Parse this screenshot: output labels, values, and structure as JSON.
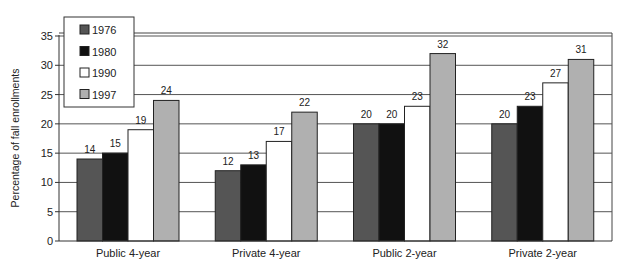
{
  "chart_data": {
    "type": "bar",
    "title": "",
    "xlabel": "",
    "ylabel": "Percentage of fall enrollments",
    "ylim": [
      0,
      35
    ],
    "yticks": [
      0,
      5,
      10,
      15,
      20,
      25,
      30,
      35
    ],
    "grid": true,
    "legend_position": "top-left",
    "categories": [
      "Public 4-year",
      "Private 4-year",
      "Public 2-year",
      "Private 2-year"
    ],
    "series": [
      {
        "name": "1976",
        "color": "#555555",
        "values": [
          14,
          12,
          20,
          20
        ]
      },
      {
        "name": "1980",
        "color": "#111111",
        "values": [
          15,
          13,
          20,
          23
        ]
      },
      {
        "name": "1990",
        "color": "#ffffff",
        "values": [
          19,
          17,
          23,
          27
        ]
      },
      {
        "name": "1997",
        "color": "#b0b0b0",
        "values": [
          24,
          22,
          32,
          31
        ]
      }
    ]
  }
}
